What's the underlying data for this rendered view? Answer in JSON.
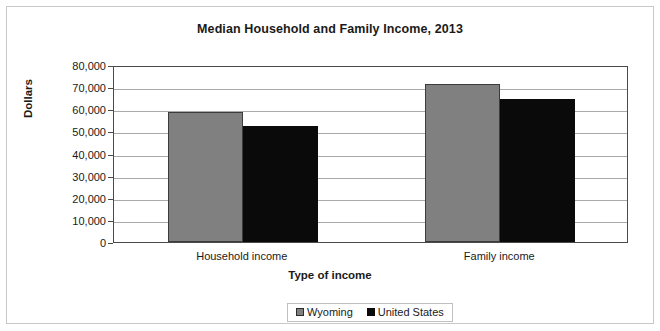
{
  "chart_data": {
    "type": "bar",
    "title": "Median Household and Family Income, 2013",
    "xlabel": "Type of income",
    "ylabel": "Dollars",
    "categories": [
      "Household income",
      "Family income"
    ],
    "series": [
      {
        "name": "Wyoming",
        "color": "#808080",
        "values": [
          58600,
          71400
        ]
      },
      {
        "name": "United States",
        "color": "#0a0a0a",
        "values": [
          52250,
          64500
        ]
      }
    ],
    "ylim": [
      0,
      80000
    ],
    "ytick_step": 10000,
    "ytick_labels": [
      "80,000",
      "70,000",
      "60,000",
      "50,000",
      "40,000",
      "30,000",
      "20,000",
      "10,000",
      "0"
    ],
    "ytick_values": [
      80000,
      70000,
      60000,
      50000,
      40000,
      30000,
      20000,
      10000,
      0
    ],
    "grid": true,
    "legend_position": "bottom"
  }
}
